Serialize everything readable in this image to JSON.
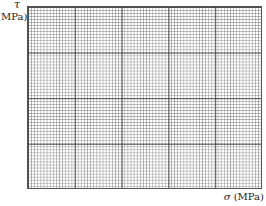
{
  "diagram": {
    "type": "blank graph-paper grid (Mohr's circle template)",
    "y_axis": {
      "symbol": "τ",
      "unit": "(MPa)"
    },
    "x_axis": {
      "symbol": "σ",
      "unit": "(MPa)"
    },
    "grid": {
      "major_divisions_x": 5,
      "major_divisions_y": 4,
      "minor_per_major": 15
    }
  }
}
